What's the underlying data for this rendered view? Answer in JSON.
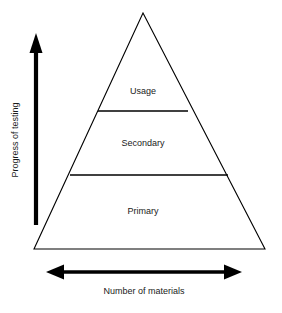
{
  "figure": {
    "type": "pyramid-diagram",
    "background_color": "#ffffff",
    "line_color": "#000000",
    "text_color": "#1a1a1a"
  },
  "pyramid": {
    "apex": {
      "x": 143,
      "y": 13
    },
    "base_left": {
      "x": 34,
      "y": 249
    },
    "base_right": {
      "x": 265,
      "y": 249
    },
    "tiers": [
      {
        "label": "Usage",
        "order": 1,
        "position": "top",
        "label_x": 143,
        "label_y": 92,
        "divider_y": 111,
        "divider_x1": 98,
        "divider_x2": 188
      },
      {
        "label": "Secondary",
        "order": 2,
        "position": "middle",
        "label_x": 143,
        "label_y": 144,
        "divider_y": 175,
        "divider_x1": 70,
        "divider_x2": 228
      },
      {
        "label": "Primary",
        "order": 3,
        "position": "bottom",
        "label_x": 143,
        "label_y": 212,
        "divider_y": null,
        "divider_x1": null,
        "divider_x2": null
      }
    ]
  },
  "vertical_axis": {
    "label": "Progress of testing",
    "direction": "up",
    "arrow_x": 36,
    "arrow_tip_y": 36,
    "arrow_base_y": 225,
    "label_x": 16,
    "label_y": 140,
    "rotation_deg": -90
  },
  "horizontal_axis": {
    "label": "Number of materials",
    "direction": "both",
    "arrow_y": 272,
    "arrow_left_x": 48,
    "arrow_right_x": 240,
    "label_x": 144,
    "label_y": 292
  }
}
